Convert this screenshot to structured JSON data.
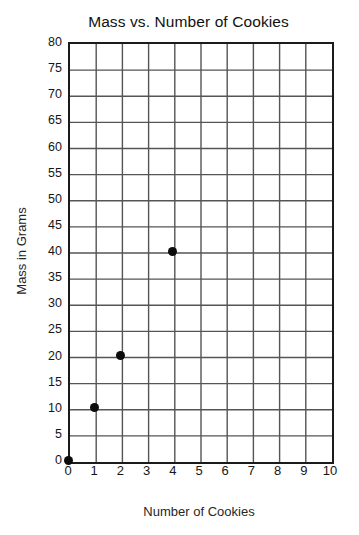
{
  "chart_data": {
    "type": "scatter",
    "title": "Mass vs. Number of Cookies",
    "xlabel": "Number of Cookies",
    "ylabel": "Mass in Grams",
    "xlim": [
      0,
      10
    ],
    "ylim": [
      0,
      80
    ],
    "xticks": [
      0,
      1,
      2,
      3,
      4,
      5,
      6,
      7,
      8,
      9,
      10
    ],
    "yticks": [
      0,
      5,
      10,
      15,
      20,
      25,
      30,
      35,
      40,
      45,
      50,
      55,
      60,
      65,
      70,
      75,
      80
    ],
    "xtick_labels": [
      "0",
      "1",
      "2",
      "3",
      "4",
      "5",
      "6",
      "7",
      "8",
      "9",
      "10"
    ],
    "ytick_labels": [
      "0",
      "5",
      "10",
      "15",
      "20",
      "25",
      "30",
      "35",
      "40",
      "45",
      "50",
      "55",
      "60",
      "65",
      "70",
      "75",
      "80"
    ],
    "grid": true,
    "grid_color": "#555555",
    "frame_color": "#1b1b1b",
    "point_color": "#0c0c0c",
    "background": "#ffffff",
    "legend": null,
    "annotations": [],
    "x": [
      0,
      1,
      2,
      4
    ],
    "y": [
      0,
      10,
      20,
      40
    ],
    "points": [
      {
        "x": 0,
        "y": 0
      },
      {
        "x": 1,
        "y": 10
      },
      {
        "x": 2,
        "y": 20
      },
      {
        "x": 4,
        "y": 40
      }
    ]
  }
}
